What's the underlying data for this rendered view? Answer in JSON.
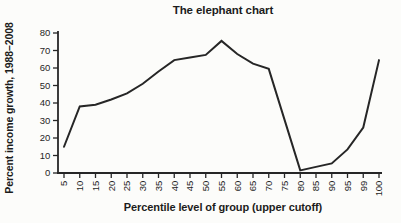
{
  "chart_data": {
    "type": "line",
    "title": "The elephant chart",
    "xlabel": "Percentile level of group (upper cutoff)",
    "ylabel": "Percent income growth, 1988–2008",
    "categories": [
      "5",
      "10",
      "15",
      "20",
      "25",
      "30",
      "35",
      "40",
      "45",
      "50",
      "55",
      "60",
      "65",
      "70",
      "75",
      "80",
      "85",
      "90",
      "95",
      "99",
      "100"
    ],
    "values": [
      15,
      38,
      39,
      42,
      45.5,
      51,
      58,
      64.5,
      66,
      67.5,
      75.5,
      68,
      62.5,
      59.5,
      30.5,
      1.5,
      3.5,
      5.5,
      13.5,
      26,
      64.5
    ],
    "y_ticks": [
      0,
      10,
      20,
      30,
      40,
      50,
      60,
      70,
      80
    ],
    "ylim": [
      0,
      80
    ],
    "grid": false,
    "legend_position": "none"
  },
  "colors": {
    "line": "#262626",
    "axis": "#262626",
    "tick_text": "#1f1f1f",
    "background": "#fcfcfa"
  }
}
